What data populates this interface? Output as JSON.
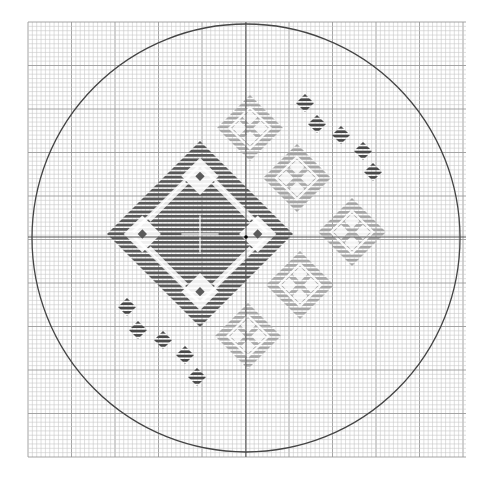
{
  "canvas": {
    "width": 495,
    "height": 478,
    "background": "#ffffff"
  },
  "grid": {
    "x0": 28,
    "y0": 22,
    "x1": 466,
    "y1": 457,
    "cell": 4.35,
    "major_every": 10,
    "minor_color": "#c8c8c8",
    "major_color": "#9a9a9a"
  },
  "circle": {
    "cx": 246,
    "cy": 238,
    "r": 214,
    "stroke": "#444444",
    "stroke_width": 1.3
  },
  "center_lines": {
    "x": 246,
    "y": 237,
    "color": "#555555"
  },
  "center_dot": {
    "x": 246,
    "y": 237,
    "r": 1.8,
    "color": "#000000"
  },
  "colors": {
    "dark": "#5a5a5a",
    "light": "#a8a8a8",
    "small": "#4a4a4a",
    "hole": "#ffffff"
  },
  "large_diamond": {
    "cx": 200,
    "cy": 234,
    "half": 93,
    "color_key": "dark"
  },
  "light_diamonds": [
    {
      "cx": 250,
      "cy": 128,
      "half": 33
    },
    {
      "cx": 297,
      "cy": 178,
      "half": 34
    },
    {
      "cx": 352,
      "cy": 232,
      "half": 34
    },
    {
      "cx": 300,
      "cy": 285,
      "half": 34
    },
    {
      "cx": 248,
      "cy": 336,
      "half": 33
    }
  ],
  "small_diamonds_top_right": [
    {
      "cx": 305,
      "cy": 103
    },
    {
      "cx": 317,
      "cy": 124
    },
    {
      "cx": 341,
      "cy": 135
    },
    {
      "cx": 363,
      "cy": 151
    },
    {
      "cx": 373,
      "cy": 172
    }
  ],
  "small_diamonds_bottom_left": [
    {
      "cx": 127,
      "cy": 307
    },
    {
      "cx": 138,
      "cy": 330
    },
    {
      "cx": 163,
      "cy": 340
    },
    {
      "cx": 185,
      "cy": 355
    },
    {
      "cx": 197,
      "cy": 377
    }
  ],
  "small_diamond_half": 9
}
